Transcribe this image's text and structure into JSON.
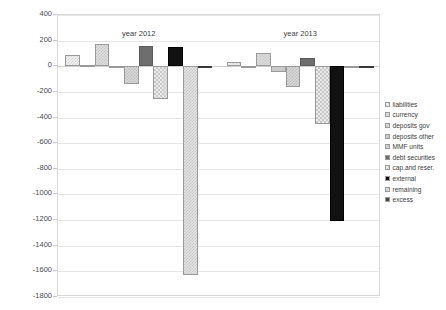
{
  "chart_data": {
    "type": "bar",
    "title": "",
    "xlabel": "",
    "ylabel": "",
    "ylim": [
      -1800,
      400
    ],
    "ytick_step": 200,
    "yticks": [
      400,
      200,
      0,
      -200,
      -400,
      -600,
      -800,
      -1000,
      -1200,
      -1400,
      -1600,
      -1800
    ],
    "ytick_labels": [
      "400",
      "200",
      "0",
      "-200",
      "-400",
      "-600",
      "-800",
      "-1000",
      "-1200",
      "-1400",
      "-1600",
      "-1800"
    ],
    "grid": true,
    "legend_position": "right",
    "categories": [
      "year 2012",
      "year 2013"
    ],
    "group_labels": [
      "year 2012",
      "year 2013"
    ],
    "series": [
      {
        "name": "liabilities",
        "values": [
          90,
          30
        ],
        "fill": "fill-check-light"
      },
      {
        "name": "currency",
        "values": [
          10,
          -15
        ],
        "fill": "fill-gray-pale"
      },
      {
        "name": "deposits gov",
        "values": [
          170,
          105
        ],
        "fill": "fill-check-med"
      },
      {
        "name": "deposits other",
        "values": [
          -10,
          -45
        ],
        "fill": "fill-gray-light"
      },
      {
        "name": "MMF units",
        "values": [
          -135,
          -165
        ],
        "fill": "fill-check-mid"
      },
      {
        "name": "debt securities",
        "values": [
          155,
          65
        ],
        "fill": "fill-gray-dark"
      },
      {
        "name": "cap.and reser.",
        "values": [
          -255,
          -450
        ],
        "fill": "fill-check-coarse"
      },
      {
        "name": "external",
        "values": [
          150,
          -1210
        ],
        "fill": "fill-black"
      },
      {
        "name": "remaining",
        "values": [
          -1630,
          -10
        ],
        "fill": "fill-check-tall"
      },
      {
        "name": "excess",
        "values": [
          -10,
          0
        ],
        "fill": "fill-dark2"
      }
    ]
  },
  "legend": {
    "items": [
      {
        "label": "liabilities"
      },
      {
        "label": "currency"
      },
      {
        "label": "deposits gov"
      },
      {
        "label": "deposits other"
      },
      {
        "label": "MMF units"
      },
      {
        "label": "debt securities"
      },
      {
        "label": "cap.and reser."
      },
      {
        "label": "external"
      },
      {
        "label": "remaining"
      },
      {
        "label": "excess"
      }
    ]
  },
  "colors": {
    "grid": "#e6e6e6",
    "frame": "#d8d8d8",
    "text": "#3d3d3d",
    "dark_bar": "#6e6e6e",
    "black_bar": "#111111"
  }
}
